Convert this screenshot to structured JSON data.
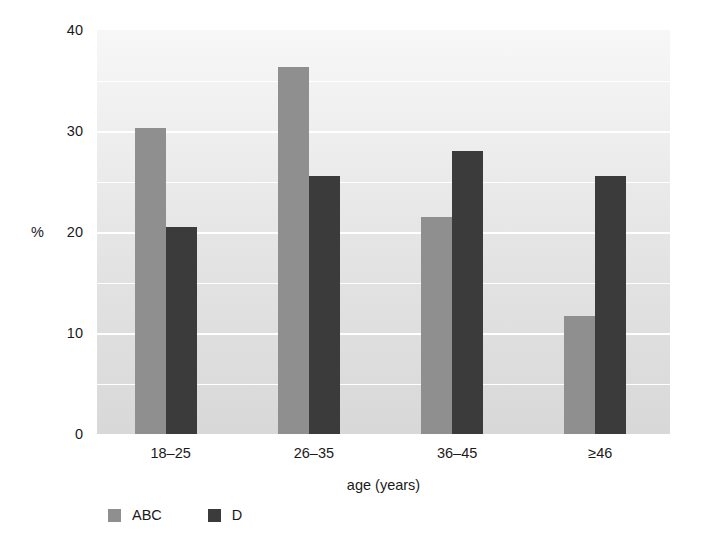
{
  "chart_data": {
    "type": "bar",
    "title": "",
    "subtitle": "",
    "xlabel": "age (years)",
    "ylabel": "%",
    "categories": [
      "18–25",
      "26–35",
      "36–45",
      "≥46"
    ],
    "series": [
      {
        "name": "ABC",
        "color": "#8f8f8f",
        "values": [
          30.3,
          36.3,
          21.5,
          11.7
        ]
      },
      {
        "name": "D",
        "color": "#3b3b3b",
        "values": [
          20.5,
          25.5,
          28.0,
          25.5
        ]
      }
    ],
    "ylim": [
      0,
      40
    ],
    "ytick_labels": [
      "0",
      "10",
      "20",
      "30",
      "40"
    ],
    "ytick_values": [
      0,
      10,
      20,
      30,
      40
    ],
    "gridlines": [
      5,
      10,
      15,
      20,
      25,
      30,
      35
    ],
    "grid": true,
    "grid_color": "#ffffff",
    "legend_position": "bottom-left",
    "plot_background": "#e8e8e8",
    "page_background": "#ffffff"
  },
  "legend": {
    "entries": [
      {
        "label": "ABC"
      },
      {
        "label": "D"
      }
    ]
  },
  "axes": {
    "y_title": "%",
    "x_title": "age (years)"
  }
}
